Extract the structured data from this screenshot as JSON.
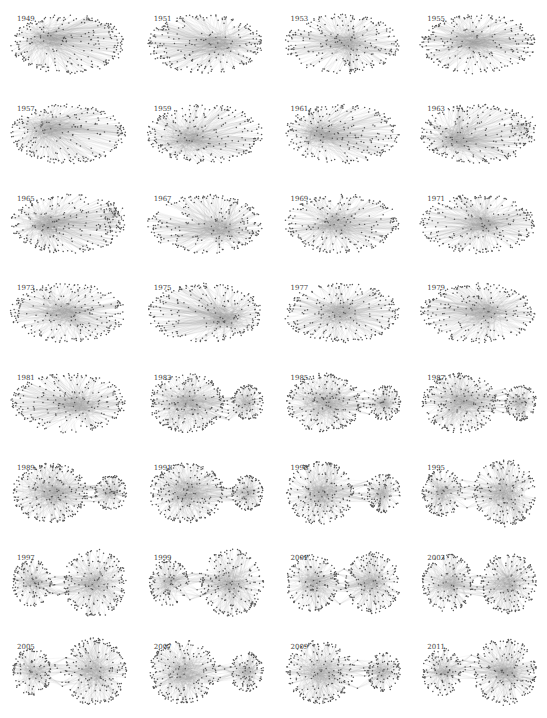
{
  "figure": {
    "type": "network-small-multiples",
    "columns": 4,
    "rows": 8,
    "colors": {
      "node": "#555555",
      "edge": "#9a9a9a",
      "background": "#ffffff",
      "label": "#444444"
    },
    "panels": [
      {
        "year": "1949",
        "layout": "oval",
        "dense": [
          0.3,
          0.4
        ]
      },
      {
        "year": "1951",
        "layout": "oval",
        "dense": [
          0.65,
          0.5
        ]
      },
      {
        "year": "1953",
        "layout": "oval",
        "dense": [
          0.55,
          0.5
        ]
      },
      {
        "year": "1955",
        "layout": "oval",
        "dense": [
          0.45,
          0.45
        ]
      },
      {
        "year": "1957",
        "layout": "oval",
        "dense": [
          0.3,
          0.4
        ]
      },
      {
        "year": "1959",
        "layout": "oval",
        "dense": [
          0.35,
          0.6
        ]
      },
      {
        "year": "1961",
        "layout": "oval",
        "dense": [
          0.3,
          0.5
        ]
      },
      {
        "year": "1963",
        "layout": "oval-split",
        "dense": [
          0.3,
          0.6
        ]
      },
      {
        "year": "1965",
        "layout": "oval-split",
        "dense": [
          0.3,
          0.5
        ]
      },
      {
        "year": "1967",
        "layout": "oval",
        "dense": [
          0.65,
          0.6
        ]
      },
      {
        "year": "1969",
        "layout": "oval",
        "dense": [
          0.45,
          0.5
        ]
      },
      {
        "year": "1971",
        "layout": "oval",
        "dense": [
          0.55,
          0.5
        ]
      },
      {
        "year": "1973",
        "layout": "oval",
        "dense": [
          0.45,
          0.5
        ]
      },
      {
        "year": "1975",
        "layout": "oval",
        "dense": [
          0.7,
          0.6
        ]
      },
      {
        "year": "1977",
        "layout": "oval",
        "dense": [
          0.5,
          0.5
        ]
      },
      {
        "year": "1979",
        "layout": "oval",
        "dense": [
          0.6,
          0.5
        ]
      },
      {
        "year": "1981",
        "layout": "oval",
        "dense": [
          0.6,
          0.55
        ]
      },
      {
        "year": "1983",
        "layout": "two-clusters-close",
        "big": "left"
      },
      {
        "year": "1985",
        "layout": "two-clusters-close",
        "big": "left"
      },
      {
        "year": "1987",
        "layout": "two-clusters-close",
        "big": "left"
      },
      {
        "year": "1989",
        "layout": "two-clusters-close",
        "big": "left"
      },
      {
        "year": "1991",
        "layout": "two-clusters-close",
        "big": "left"
      },
      {
        "year": "1993",
        "layout": "two-clusters",
        "big": "left"
      },
      {
        "year": "1995",
        "layout": "two-clusters",
        "big": "right"
      },
      {
        "year": "1997",
        "layout": "two-clusters",
        "big": "right"
      },
      {
        "year": "1999",
        "layout": "two-clusters",
        "big": "right"
      },
      {
        "year": "2001",
        "layout": "two-clusters",
        "big": "equal"
      },
      {
        "year": "2003",
        "layout": "two-clusters",
        "big": "equal"
      },
      {
        "year": "2005",
        "layout": "two-clusters-far",
        "big": "right"
      },
      {
        "year": "2007",
        "layout": "two-clusters-far",
        "big": "left"
      },
      {
        "year": "2009",
        "layout": "two-clusters",
        "big": "left"
      },
      {
        "year": "2011",
        "layout": "two-clusters",
        "big": "right"
      }
    ]
  }
}
